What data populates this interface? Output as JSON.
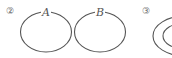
{
  "figures": [
    {
      "number": "②",
      "sets": [
        {
          "label": "A"
        },
        {
          "label": "B"
        }
      ],
      "relation": "disjoint"
    },
    {
      "number": "③",
      "relation": "nested"
    }
  ]
}
